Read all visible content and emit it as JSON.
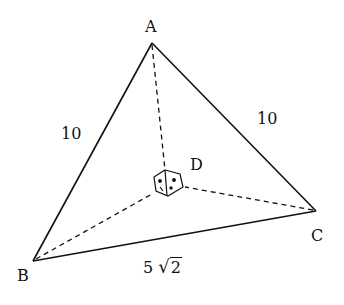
{
  "diagram": {
    "type": "tetrahedron",
    "vertices": {
      "A": {
        "label": "A",
        "x": 152,
        "y": 43
      },
      "B": {
        "label": "B",
        "x": 33,
        "y": 261
      },
      "C": {
        "label": "C",
        "x": 316,
        "y": 211
      },
      "D": {
        "label": "D",
        "x": 167,
        "y": 181
      }
    },
    "edge_labels": {
      "AB": "10",
      "AC": "10",
      "BC_coef": "5",
      "BC_radicand": "2"
    },
    "solid_edges": [
      "AB",
      "AC",
      "BC"
    ],
    "dashed_edges": [
      "AD",
      "BD",
      "CD"
    ],
    "right_angle_marker_at": "D",
    "stroke_color": "#111111"
  }
}
